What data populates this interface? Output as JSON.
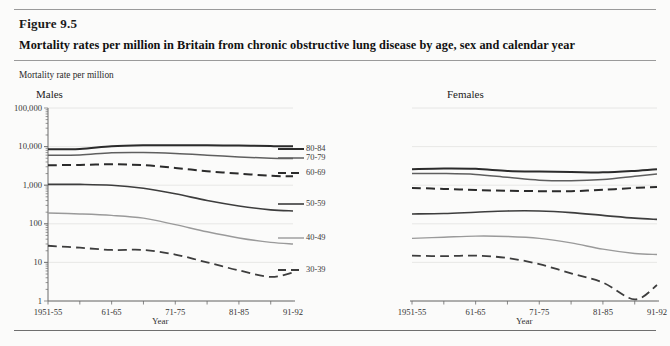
{
  "figure": {
    "number": "Figure 9.5",
    "title": "Mortality rates per million in Britain from chronic obstructive lung disease by age, sex and calendar year"
  },
  "axis_caption": "Mortality rate per million",
  "panels": {
    "males_label": "Males",
    "females_label": "Females"
  },
  "xaxis_name": "Year",
  "legend": {
    "items": [
      {
        "label": "80-84",
        "style": "solid",
        "color": "#2b2b2b",
        "width": 2.0
      },
      {
        "label": "70-79",
        "style": "solid",
        "color": "#5f5f5f",
        "width": 1.5
      },
      {
        "label": "60-69",
        "style": "dashed",
        "color": "#2b2b2b",
        "width": 2.0
      },
      {
        "label": "50-59",
        "style": "solid",
        "color": "#3d3d3d",
        "width": 1.6
      },
      {
        "label": "40-49",
        "style": "solid",
        "color": "#9a9a9a",
        "width": 1.4
      },
      {
        "label": "30-39",
        "style": "dashed",
        "color": "#3d3d3d",
        "width": 1.8
      }
    ]
  },
  "chart_data": {
    "type": "line",
    "title": "Mortality rates per million in Britain from chronic obstructive lung disease by age, sex and calendar year",
    "xlabel": "Year",
    "ylabel": "Mortality rate per million",
    "yscale": "log",
    "ylim": [
      1,
      100000
    ],
    "ytick_labels": [
      "100,000",
      "10,000",
      "1,000",
      "100",
      "10",
      "1"
    ],
    "ytick_values": [
      100000,
      10000,
      1000,
      100,
      10,
      1
    ],
    "xtick_labels": [
      "1951-55",
      "61-65",
      "71-75",
      "81-85",
      "91-92"
    ],
    "x": [
      1953,
      1958,
      1963,
      1968,
      1973,
      1978,
      1983,
      1988,
      1991.5
    ],
    "grid": true,
    "legend_position": "right-of-males-panel",
    "panels": [
      {
        "name": "Males",
        "series": [
          {
            "name": "80-84",
            "values": [
              8500,
              8700,
              10200,
              10800,
              10900,
              10800,
              10600,
              10300,
              10200
            ]
          },
          {
            "name": "70-79",
            "values": [
              6000,
              6100,
              6900,
              7000,
              6600,
              6000,
              5400,
              5000,
              4900
            ]
          },
          {
            "name": "60-69",
            "values": [
              3300,
              3350,
              3500,
              3300,
              2800,
              2300,
              2000,
              1750,
              1700
            ]
          },
          {
            "name": "50-59",
            "values": [
              1050,
              1050,
              1000,
              830,
              600,
              400,
              290,
              230,
              215
            ]
          },
          {
            "name": "40-49",
            "values": [
              190,
              180,
              165,
              140,
              95,
              62,
              43,
              33,
              30
            ]
          },
          {
            "name": "30-39",
            "values": [
              27,
              24,
              21,
              21,
              16,
              10,
              6.2,
              4.2,
              5.5
            ]
          }
        ]
      },
      {
        "name": "Females",
        "series": [
          {
            "name": "80-84",
            "values": [
              2600,
              2700,
              2650,
              2350,
              2250,
              2200,
              2150,
              2350,
              2600
            ]
          },
          {
            "name": "70-79",
            "values": [
              2000,
              2000,
              1900,
              1600,
              1350,
              1300,
              1400,
              1700,
              1950
            ]
          },
          {
            "name": "60-69",
            "values": [
              850,
              800,
              750,
              720,
              700,
              700,
              760,
              850,
              900
            ]
          },
          {
            "name": "50-59",
            "values": [
              180,
              185,
              200,
              215,
              215,
              195,
              165,
              140,
              130
            ]
          },
          {
            "name": "40-49",
            "values": [
              42,
              45,
              48,
              47,
              42,
              32,
              22,
              17,
              16
            ]
          },
          {
            "name": "30-39",
            "values": [
              15,
              14.5,
              15,
              13,
              9,
              5.2,
              3.0,
              1.1,
              2.6
            ]
          }
        ]
      }
    ]
  }
}
